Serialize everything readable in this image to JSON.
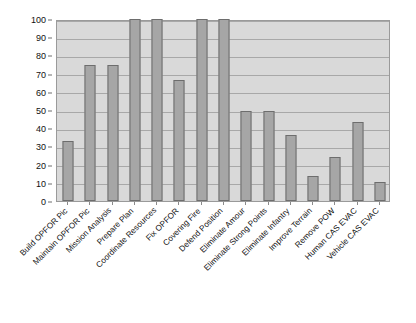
{
  "chart_data": {
    "type": "bar",
    "title": "",
    "subtitle": "",
    "xlabel": "",
    "ylabel": "",
    "ylim": [
      0,
      100
    ],
    "ytick_step": 10,
    "yticks": [
      0,
      10,
      20,
      30,
      40,
      50,
      60,
      70,
      80,
      90,
      100
    ],
    "grid": true,
    "legend": false,
    "legend_position": "none",
    "orientation": "vertical",
    "categories": [
      "Build OPFOR Pic",
      "Maintain OPFOR Pic",
      "Mission Analysis",
      "Prepare Plan",
      "Coordinate Resources",
      "Fix OPFOR",
      "Covering Fire",
      "Defend Position",
      "Eliminate Amour",
      "Eliminate Strong Points",
      "Eliminate Infantry",
      "Improve Terrain",
      "Remove POW",
      "Human CAS EVAC",
      "Vehicle CAS EVAC"
    ],
    "values": [
      33,
      75,
      75,
      100,
      100,
      66.5,
      100,
      100,
      49.5,
      49.5,
      36.5,
      14,
      24,
      43.5,
      10.5
    ],
    "series": [
      {
        "name": "",
        "values": [
          33,
          75,
          75,
          100,
          100,
          66.5,
          100,
          100,
          49.5,
          49.5,
          36.5,
          14,
          24,
          43.5,
          10.5
        ]
      }
    ]
  },
  "style": {
    "plot_background": "#d9d9d9",
    "bar_fill": "#a6a6a6",
    "bar_border": "#6d6d6d",
    "gridline_color": "#a8a8a8",
    "axis_color": "#9a9a9a",
    "text_color": "#111111",
    "page_background": "#ffffff"
  }
}
